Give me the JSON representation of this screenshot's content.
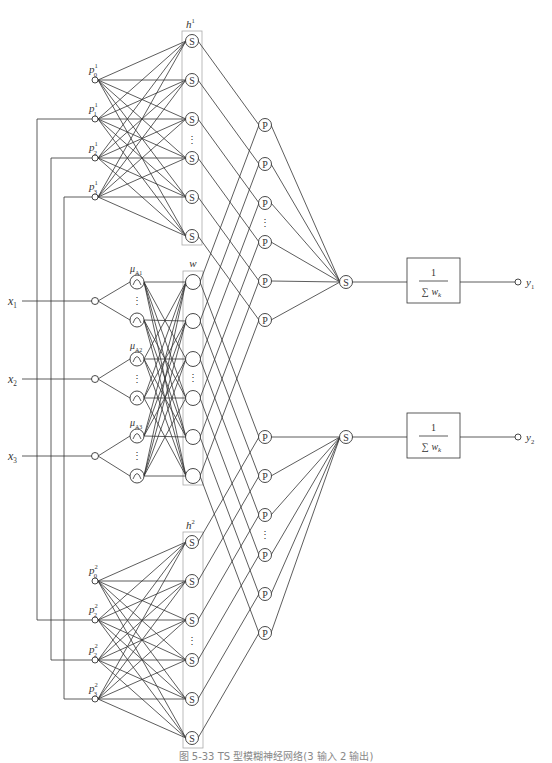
{
  "diagram": {
    "caption": "图 5-33  TS 型模糊神经网络(3 输入 2 输出)",
    "colors": {
      "line": "#333333",
      "box": "#aaaaaa",
      "background": "#ffffff"
    },
    "layers": {
      "consequent_top": {
        "label": "h",
        "label_sup": "1",
        "node_glyph": "S",
        "inputs": [
          {
            "base": "p",
            "sub": "0",
            "sup": "1"
          },
          {
            "base": "p",
            "sub": "1",
            "sup": "1"
          },
          {
            "base": "p",
            "sub": "2",
            "sup": "1"
          },
          {
            "base": "p",
            "sub": "3",
            "sup": "1"
          }
        ]
      },
      "inputs": [
        {
          "base": "x",
          "sub": "1"
        },
        {
          "base": "x",
          "sub": "2"
        },
        {
          "base": "x",
          "sub": "3"
        }
      ],
      "membership": [
        {
          "base": "μ",
          "sub": "A1"
        },
        {
          "base": "μ",
          "sub": "A2"
        },
        {
          "base": "μ",
          "sub": "A3"
        }
      ],
      "rule_layer": {
        "label": "w"
      },
      "product_glyph": "P",
      "sum_glyph": "S",
      "consequent_bottom": {
        "label": "h",
        "label_sup": "2",
        "node_glyph": "S",
        "inputs": [
          {
            "base": "p",
            "sub": "0",
            "sup": "2"
          },
          {
            "base": "p",
            "sub": "2",
            "sup": "2"
          },
          {
            "base": "p",
            "sub": "2",
            "sup": "2"
          },
          {
            "base": "p",
            "sub": "3",
            "sup": "2"
          }
        ]
      },
      "normalizers": [
        {
          "numerator": "1",
          "denominator": "∑ w",
          "denominator_sub": "k"
        },
        {
          "numerator": "1",
          "denominator": "∑ w",
          "denominator_sub": "k"
        }
      ],
      "outputs": [
        {
          "base": "y",
          "sub": "1"
        },
        {
          "base": "y",
          "sub": "2"
        }
      ]
    },
    "ellipsis": "⋮"
  }
}
